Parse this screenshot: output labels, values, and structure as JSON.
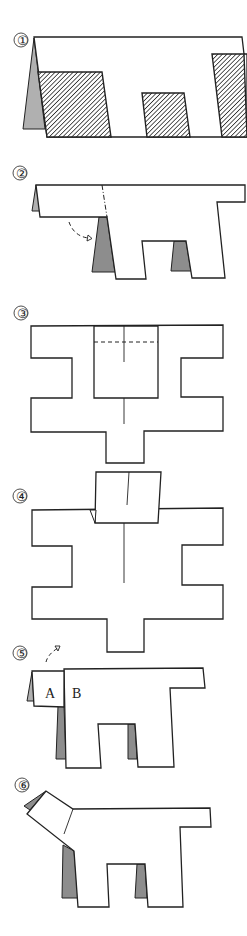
{
  "diagram": {
    "steps": [
      {
        "number": "①",
        "description": "Folded paper with hatched regions to cut away"
      },
      {
        "number": "②",
        "description": "Cut shape; fold head along dash-dot line (arrow)"
      },
      {
        "number": "③",
        "description": "Unfolded cross shape with valley fold dashed line"
      },
      {
        "number": "④",
        "description": "Top flap folded down"
      },
      {
        "number": "⑤",
        "description": "Head flap fold with labels A and B"
      },
      {
        "number": "⑥",
        "description": "Finished dog"
      }
    ],
    "labels": {
      "a": "A",
      "b": "B"
    },
    "colors": {
      "line": "#222222",
      "shade_dark": "#8d8d8d",
      "shade_light": "#b0b0b0",
      "background": "#ffffff"
    }
  }
}
